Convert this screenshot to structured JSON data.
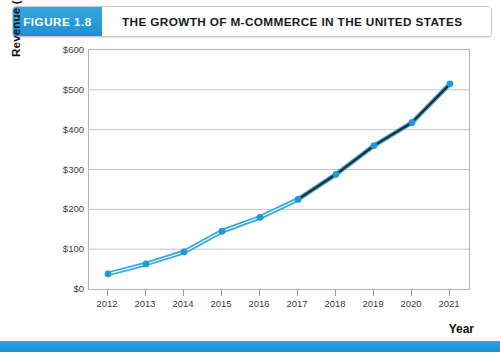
{
  "header": {
    "figure_tag": "FIGURE 1.8",
    "title": "THE GROWTH OF M-COMMERCE IN THE UNITED STATES"
  },
  "colors": {
    "brand_blue": "#2ea4de",
    "line_blue": "#35a8e0",
    "marker_blue": "#1f9ad6",
    "forecast_dark": "#2b2b2b",
    "gridline": "#c3c3c3",
    "plot_border": "#b4b4b4",
    "tick_text": "#3b3b3b"
  },
  "chart_data": {
    "type": "line",
    "title": "THE GROWTH OF M-COMMERCE IN THE UNITED STATES",
    "xlabel": "Year",
    "ylabel": "Revenue (Billions)",
    "categories": [
      "2012",
      "2013",
      "2014",
      "2015",
      "2016",
      "2017",
      "2018",
      "2019",
      "2020",
      "2021"
    ],
    "x": [
      2012,
      2013,
      2014,
      2015,
      2016,
      2017,
      2018,
      2019,
      2020,
      2021
    ],
    "values": [
      38,
      63,
      93,
      145,
      180,
      225,
      288,
      360,
      418,
      515
    ],
    "ylim": [
      0,
      600
    ],
    "ytick_values": [
      0,
      100,
      200,
      300,
      400,
      500,
      600
    ],
    "ytick_labels": [
      "$0",
      "$100",
      "$200",
      "$300",
      "$400",
      "$500",
      "$600"
    ],
    "grid": true,
    "legend": "none",
    "series": [
      {
        "name": "Actual",
        "style": "solid-blue",
        "x": [
          2012,
          2013,
          2014,
          2015,
          2016,
          2017
        ],
        "values": [
          38,
          63,
          93,
          145,
          180,
          225
        ]
      },
      {
        "name": "Projected",
        "style": "solid-dark",
        "x": [
          2017,
          2018,
          2019,
          2020,
          2021
        ],
        "values": [
          225,
          288,
          360,
          418,
          515
        ]
      }
    ]
  }
}
